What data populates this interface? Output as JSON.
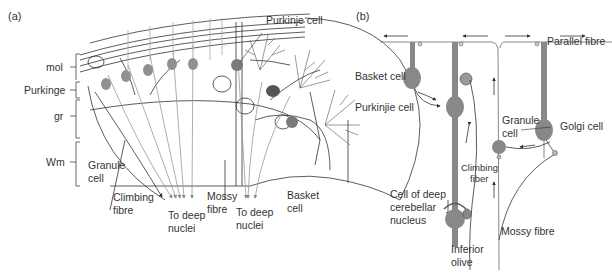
{
  "panels": {
    "a": {
      "tag": "(a)",
      "layers": {
        "mol": "mol",
        "purkinje": "Purkinge",
        "gr": "gr",
        "wm": "Wm"
      },
      "labels": {
        "purkinje_cell": "Purkinje cell",
        "granule_cell_1": "Granule",
        "granule_cell_2": "cell",
        "climbing_fibre_1": "Climbing",
        "climbing_fibre_2": "fibre",
        "to_deep_nuclei_left_1": "To deep",
        "to_deep_nuclei_left_2": "nuclei",
        "mossy_fibre_1": "Mossy",
        "mossy_fibre_2": "fibre",
        "to_deep_nuclei_right_1": "To deep",
        "to_deep_nuclei_right_2": "nuclei",
        "basket_cell_1": "Basket",
        "basket_cell_2": "cell"
      }
    },
    "b": {
      "tag": "(b)",
      "labels": {
        "parallel_fibre": "Parallel fibre",
        "basket_cell": "Basket cell",
        "purkinje_cell": "Purkinjie cell",
        "granule_cell_1": "Granule",
        "granule_cell_2": "cell",
        "golgi_cell": "Golgi cell",
        "climbing_fiber_1": "Climbing",
        "climbing_fiber_2": "fiber",
        "deep_nucleus_1": "Cell of deep",
        "deep_nucleus_2": "cerebellar",
        "deep_nucleus_3": "nucleus",
        "mossy_fibre": "Mossy fibre",
        "inferior_olive_1": "Inferior",
        "inferior_olive_2": "olive"
      }
    }
  },
  "colors": {
    "line": "#333333",
    "fibre_grey": "#8a8a8a",
    "cell_body": "#8c8c8c",
    "background": "#ffffff"
  }
}
